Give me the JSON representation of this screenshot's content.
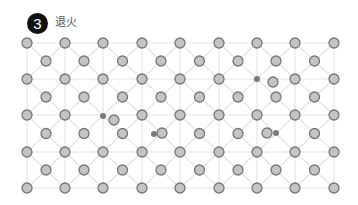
{
  "header": {
    "step_number": "3",
    "title": "退火"
  },
  "colors": {
    "badge_bg": "#111111",
    "badge_text": "#ffffff",
    "grid_line": "#e4e4e4",
    "atom_fill": "#c4c4c4",
    "atom_stroke": "#777777",
    "defect_dot": "#7a7a7a"
  },
  "lattice": {
    "corner_columns_x": [
      27,
      65,
      103,
      142,
      180,
      219,
      257,
      295,
      334
    ],
    "corner_rows_y": [
      43,
      79,
      115,
      152,
      188
    ],
    "atom_radius": 5,
    "defect_radius": 3,
    "vacant_corner_sites": [
      [
        103,
        115
      ],
      [
        257,
        79
      ]
    ],
    "vacant_center_sites": [
      [
        161,
        134
      ],
      [
        276,
        134
      ]
    ],
    "displaced_atoms": [
      [
        114,
        120
      ],
      [
        162,
        133
      ],
      [
        273,
        82
      ],
      [
        267,
        133
      ]
    ],
    "defect_dots": [
      [
        103,
        116
      ],
      [
        154,
        134
      ],
      [
        257,
        79
      ],
      [
        276,
        133
      ]
    ]
  }
}
